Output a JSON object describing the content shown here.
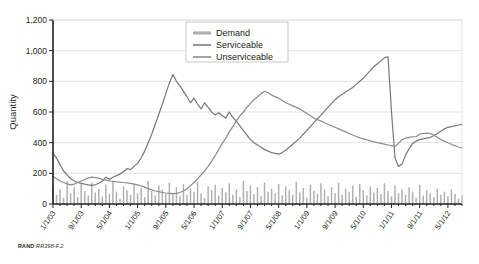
{
  "credit": {
    "org": "RAND",
    "ref": "RR398-F.2"
  },
  "chart_data": {
    "type": "line",
    "title": "",
    "xlabel": "",
    "ylabel": "Quantity",
    "ylim": [
      0,
      1200
    ],
    "yticks": [
      0,
      200,
      400,
      600,
      800,
      1000,
      1200
    ],
    "ytick_labels": [
      "0",
      "200",
      "400",
      "600",
      "800",
      "1,000",
      "1,200"
    ],
    "grid": true,
    "legend_position": "top-right",
    "xtick_labels": [
      "1/1/03",
      "9/1/03",
      "5/1/04",
      "1/1/05",
      "9/1/05",
      "5/1/06",
      "1/1/07",
      "9/1/07",
      "5/1/08",
      "1/1/09",
      "9/1/09",
      "5/1/10",
      "1/1/11",
      "9/1/11",
      "5/1/12"
    ],
    "x_start": "1/1/03",
    "x_end": "9/1/12",
    "x_points": 117,
    "colors": {
      "demand": "#b0b0b0",
      "serviceable": "#7a7a7a",
      "unserviceable": "#8c8c8c"
    },
    "series": [
      {
        "name": "Demand",
        "render": "bars",
        "color": "#b0b0b0",
        "values": [
          120,
          60,
          95,
          40,
          150,
          70,
          110,
          45,
          130,
          85,
          55,
          140,
          75,
          100,
          50,
          125,
          65,
          145,
          80,
          35,
          115,
          90,
          60,
          135,
          70,
          105,
          45,
          150,
          85,
          55,
          120,
          95,
          65,
          140,
          75,
          110,
          50,
          130,
          60,
          100,
          80,
          145,
          70,
          40,
          115,
          90,
          125,
          55,
          105,
          75,
          135,
          60,
          95,
          45,
          150,
          85,
          120,
          65,
          110,
          50,
          140,
          80,
          100,
          70,
          130,
          55,
          115,
          90,
          60,
          145,
          75,
          105,
          40,
          125,
          85,
          65,
          135,
          95,
          50,
          110,
          70,
          140,
          60,
          100,
          80,
          120,
          45,
          130,
          90,
          55,
          115,
          75,
          105,
          65,
          135,
          85,
          50,
          120,
          70,
          95,
          60,
          110,
          80,
          40,
          125,
          55,
          90,
          70,
          45,
          100,
          60,
          80,
          50,
          95,
          65,
          35,
          55
        ]
      },
      {
        "name": "Serviceable",
        "render": "line",
        "color": "#7a7a7a",
        "values": [
          330,
          300,
          255,
          215,
          190,
          165,
          150,
          140,
          135,
          130,
          125,
          122,
          125,
          135,
          150,
          175,
          160,
          175,
          185,
          195,
          210,
          230,
          225,
          245,
          265,
          300,
          345,
          400,
          455,
          520,
          585,
          650,
          720,
          790,
          845,
          800,
          770,
          735,
          700,
          660,
          690,
          650,
          620,
          660,
          630,
          600,
          580,
          595,
          575,
          560,
          600,
          565,
          540,
          510,
          480,
          450,
          420,
          400,
          385,
          370,
          355,
          345,
          335,
          330,
          325,
          335,
          350,
          370,
          390,
          410,
          430,
          455,
          480,
          505,
          530,
          555,
          580,
          605,
          630,
          655,
          680,
          700,
          715,
          730,
          745,
          760,
          780,
          800,
          820,
          845,
          870,
          895,
          915,
          935,
          955,
          960,
          600,
          300,
          245,
          260,
          320,
          360,
          395,
          410,
          420,
          425,
          430,
          435,
          445,
          460,
          475,
          490,
          500,
          505,
          510,
          515,
          520
        ]
      },
      {
        "name": "Unserviceable",
        "render": "line",
        "color": "#8c8c8c",
        "values": [
          180,
          165,
          150,
          140,
          132,
          125,
          130,
          140,
          150,
          160,
          170,
          175,
          172,
          168,
          160,
          155,
          150,
          148,
          145,
          142,
          140,
          138,
          135,
          130,
          125,
          118,
          110,
          100,
          92,
          85,
          80,
          75,
          72,
          70,
          68,
          70,
          75,
          85,
          100,
          120,
          140,
          165,
          190,
          215,
          245,
          280,
          315,
          355,
          395,
          430,
          470,
          505,
          540,
          575,
          600,
          630,
          655,
          680,
          700,
          720,
          735,
          725,
          710,
          700,
          690,
          675,
          660,
          650,
          640,
          630,
          620,
          605,
          590,
          575,
          560,
          550,
          540,
          530,
          520,
          510,
          500,
          490,
          480,
          470,
          460,
          450,
          440,
          432,
          425,
          418,
          412,
          405,
          400,
          395,
          390,
          385,
          380,
          375,
          395,
          420,
          430,
          435,
          438,
          440,
          455,
          460,
          462,
          460,
          450,
          435,
          420,
          410,
          400,
          390,
          380,
          372,
          365
        ]
      }
    ]
  }
}
